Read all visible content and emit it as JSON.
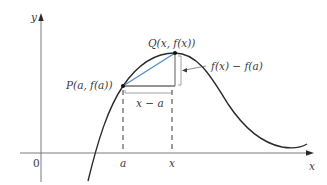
{
  "diagram": {
    "colors": {
      "curve": "#2a2a2a",
      "secant": "#4f8fc4",
      "axes": "#7a7a7a",
      "guides": "#3a3a3a",
      "text": "#3a3a3a"
    },
    "axes": {
      "y_label": "y",
      "x_label": "x",
      "origin_label": "0"
    },
    "ticks": {
      "a_label": "a",
      "x_label": "x"
    },
    "points": {
      "P_label": "P(a, f(a))",
      "Q_label": "Q(x, f(x))"
    },
    "annotations": {
      "rise_label": "f(x) − f(a)",
      "run_label": "x − a"
    }
  }
}
